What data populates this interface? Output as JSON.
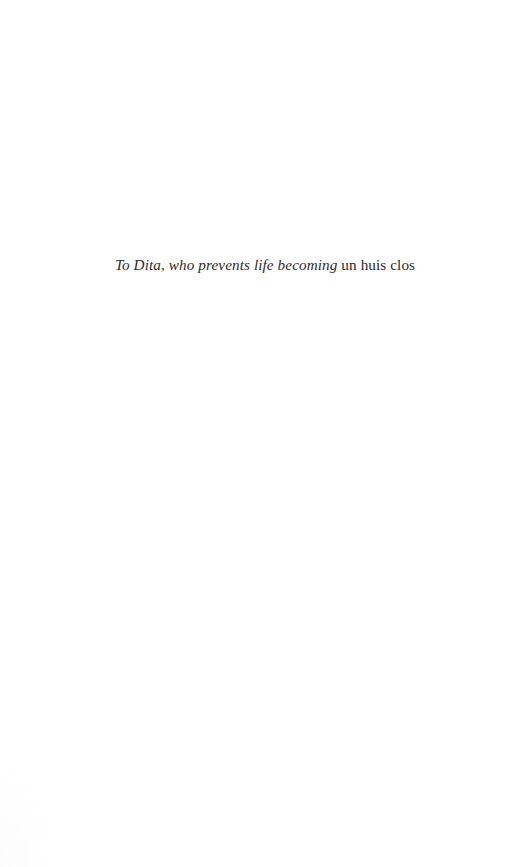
{
  "page": {
    "type": "book-dedication-page",
    "background_color": "#ffffff",
    "text_color": "#2b2a2c"
  },
  "dedication": {
    "full_text": "To Dita, who prevents life becoming un huis clos",
    "italic_part": "To Dita, who prevents life becoming",
    "roman_part": "un huis clos",
    "spacer": " "
  }
}
